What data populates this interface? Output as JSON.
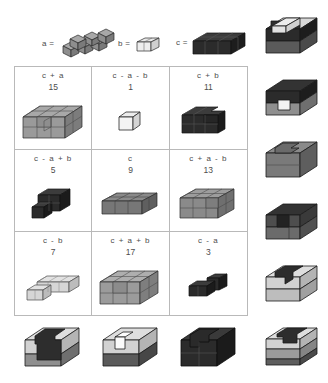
{
  "legend": {
    "items": [
      {
        "name": "piece-a",
        "label": "a =",
        "cubes": 6,
        "shade": "mid"
      },
      {
        "name": "piece-b",
        "label": "b =",
        "cubes": 2,
        "shade": "light"
      },
      {
        "name": "piece-c",
        "label": "c =",
        "cubes": 9,
        "shade": "dark"
      }
    ]
  },
  "grid": {
    "rows": 3,
    "cols": 3,
    "cells": [
      {
        "expr": "c + a",
        "value": "15",
        "shade": "mid",
        "figure": "block-15"
      },
      {
        "expr": "c - a - b",
        "value": "1",
        "shade": "light",
        "figure": "single-cube"
      },
      {
        "expr": "c + b",
        "value": "11",
        "shade": "dark",
        "figure": "block-11"
      },
      {
        "expr": "c - a + b",
        "value": "5",
        "shade": "dark",
        "figure": "block-5"
      },
      {
        "expr": "c",
        "value": "9",
        "shade": "mid",
        "figure": "block-9"
      },
      {
        "expr": "c + a - b",
        "value": "13",
        "shade": "mid",
        "figure": "block-13"
      },
      {
        "expr": "c - b",
        "value": "7",
        "shade": "light",
        "figure": "block-7"
      },
      {
        "expr": "c + a + b",
        "value": "17",
        "shade": "mid",
        "figure": "block-17"
      },
      {
        "expr": "c - a",
        "value": "3",
        "shade": "dark",
        "figure": "block-3"
      }
    ]
  },
  "side_figures": {
    "right": [
      {
        "name": "side-figure-1",
        "top_shade": "light",
        "body_shade": "dark",
        "notch": "top-left-dark"
      },
      {
        "name": "side-figure-2",
        "top_shade": "dark",
        "body_shade": "mid",
        "notch": "front-white"
      },
      {
        "name": "side-figure-3",
        "top_shade": "mid",
        "body_shade": "mid",
        "notch": "top-step"
      },
      {
        "name": "side-figure-4",
        "top_shade": "dark",
        "body_shade": "mid",
        "notch": "front-dark"
      },
      {
        "name": "side-figure-5",
        "top_shade": "light",
        "body_shade": "light",
        "notch": "top-dark-L"
      },
      {
        "name": "side-figure-6",
        "top_shade": "light",
        "body_shade": "light",
        "notch": "top-dark-bar"
      }
    ],
    "bottom": [
      {
        "name": "bottom-figure-1",
        "top_shade": "light",
        "body_shade": "dark",
        "notch": "front-dark"
      },
      {
        "name": "bottom-figure-2",
        "top_shade": "light",
        "body_shade": "light",
        "notch": "front-white"
      },
      {
        "name": "bottom-figure-3",
        "top_shade": "dark",
        "body_shade": "dark",
        "notch": "top-step"
      }
    ]
  },
  "colors": {
    "light_top": "#e9e9e9",
    "light_front": "#d2d2d2",
    "light_side": "#bdbdbd",
    "mid_top": "#a8a8a8",
    "mid_front": "#8e8e8e",
    "mid_side": "#7a7a7a",
    "dark_top": "#3c3c3c",
    "dark_front": "#2b2b2b",
    "dark_side": "#1d1d1d",
    "outline": "#2a2a2a",
    "grid_border": "#b9b9b9",
    "text": "#4d4d4d",
    "background": "#ffffff"
  }
}
